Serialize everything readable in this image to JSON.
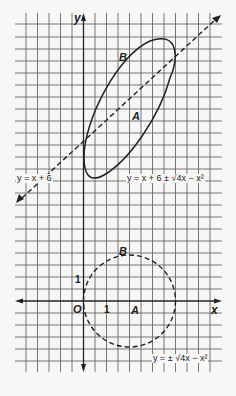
{
  "figure": {
    "type": "math-diagram",
    "top_graph": {
      "axis_label_y": "y",
      "line_equation": "y = x + 6",
      "curve_equation": "y = x + 6 ± √4x − x²",
      "region_labels": [
        "A",
        "B"
      ]
    },
    "bottom_graph": {
      "axis_label_x": "x",
      "origin_label": "O",
      "tick_x": "1",
      "tick_y": "1",
      "curve_equation": "y = ± √4x − x²",
      "region_labels": [
        "A",
        "B"
      ]
    },
    "colors": {
      "ink": "#222222",
      "grid": "#555555",
      "background": "#f7f7f5"
    }
  }
}
